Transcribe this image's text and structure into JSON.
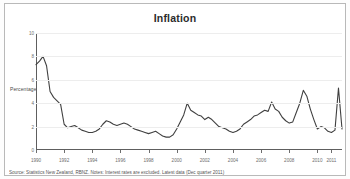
{
  "figure": {
    "title": "Inflation",
    "source_note": "Source: Statistics New Zealand, RBNZ. Notes: Interest rates are excluded. Latest data (Dec quarter 2011)"
  },
  "chart_data": {
    "type": "line",
    "title": "Inflation",
    "xlabel": "",
    "ylabel": "Percentage",
    "ylim": [
      0,
      10
    ],
    "xlim": [
      1990,
      2011.75
    ],
    "y_ticks": [
      0,
      2,
      4,
      6,
      8,
      10
    ],
    "x_ticks": [
      1990,
      1992,
      1994,
      1996,
      1998,
      2000,
      2002,
      2004,
      2006,
      2008,
      2010,
      2011
    ],
    "x_tick_labels": [
      "1990",
      "1992",
      "1994",
      "1996",
      "1998",
      "2000",
      "2002",
      "2004",
      "2006",
      "2008",
      "2010",
      "2011"
    ],
    "grid": true,
    "legend": "none",
    "line_color": "#404040",
    "series": [
      {
        "name": "Inflation",
        "x": [
          1990.0,
          1990.25,
          1990.5,
          1990.75,
          1991.0,
          1991.25,
          1991.5,
          1991.75,
          1992.0,
          1992.25,
          1992.5,
          1992.75,
          1993.0,
          1993.25,
          1993.5,
          1993.75,
          1994.0,
          1994.25,
          1994.5,
          1994.75,
          1995.0,
          1995.25,
          1995.5,
          1995.75,
          1996.0,
          1996.25,
          1996.5,
          1996.75,
          1997.0,
          1997.25,
          1997.5,
          1997.75,
          1998.0,
          1998.25,
          1998.5,
          1998.75,
          1999.0,
          1999.25,
          1999.5,
          1999.75,
          2000.0,
          2000.25,
          2000.5,
          2000.75,
          2001.0,
          2001.25,
          2001.5,
          2001.75,
          2002.0,
          2002.25,
          2002.5,
          2002.75,
          2003.0,
          2003.25,
          2003.5,
          2003.75,
          2004.0,
          2004.25,
          2004.5,
          2004.75,
          2005.0,
          2005.25,
          2005.5,
          2005.75,
          2006.0,
          2006.25,
          2006.5,
          2006.75,
          2007.0,
          2007.25,
          2007.5,
          2007.75,
          2008.0,
          2008.25,
          2008.5,
          2008.75,
          2009.0,
          2009.25,
          2009.5,
          2009.75,
          2010.0,
          2010.25,
          2010.5,
          2010.75,
          2011.0,
          2011.25,
          2011.5,
          2011.75
        ],
        "values": [
          7.3,
          7.6,
          8.0,
          7.2,
          5.0,
          4.5,
          4.2,
          3.9,
          2.2,
          1.9,
          2.0,
          2.1,
          1.9,
          1.7,
          1.6,
          1.5,
          1.5,
          1.6,
          1.8,
          2.2,
          2.5,
          2.4,
          2.2,
          2.1,
          2.2,
          2.3,
          2.2,
          2.0,
          1.8,
          1.7,
          1.6,
          1.5,
          1.4,
          1.5,
          1.6,
          1.4,
          1.2,
          1.1,
          1.1,
          1.3,
          1.8,
          2.4,
          3.0,
          4.0,
          3.4,
          3.2,
          3.0,
          2.9,
          2.6,
          2.8,
          2.6,
          2.3,
          2.0,
          1.9,
          1.8,
          1.6,
          1.5,
          1.6,
          1.8,
          2.2,
          2.4,
          2.6,
          2.9,
          3.0,
          3.2,
          3.4,
          3.3,
          4.1,
          3.5,
          3.3,
          2.8,
          2.5,
          2.3,
          2.4,
          3.2,
          4.0,
          5.1,
          4.6,
          3.5,
          2.6,
          1.8,
          2.0,
          1.9,
          1.6,
          1.5,
          1.7,
          5.3,
          1.8
        ]
      }
    ]
  }
}
